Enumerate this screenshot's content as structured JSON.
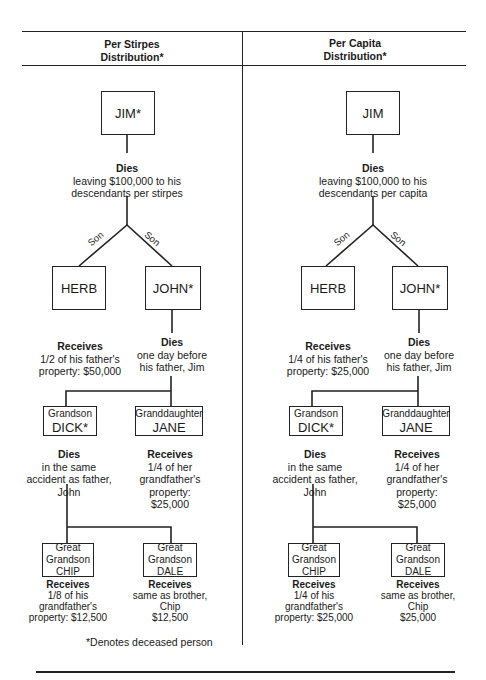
{
  "headers": {
    "left": [
      "Per Stirpes",
      "Distribution*"
    ],
    "right": [
      "Per Capita",
      "Distribution*"
    ]
  },
  "relation_label": "Son",
  "footnote": "*Denotes deceased person",
  "trees": [
    {
      "id": "per-stirpes",
      "jim": {
        "name": "JIM*"
      },
      "jim_text": {
        "title": "Dies",
        "lines": [
          "leaving $100,000 to his",
          "descendants per stirpes"
        ]
      },
      "herb": {
        "name": "HERB"
      },
      "herb_text": {
        "title": "Receives",
        "lines": [
          "1/2 of his father's",
          "property: $50,000"
        ]
      },
      "john": {
        "name": "JOHN*"
      },
      "john_text": {
        "title": "Dies",
        "lines": [
          "one day before",
          "his father, Jim"
        ]
      },
      "dick": {
        "role": "Grandson",
        "name": "DICK*"
      },
      "dick_text": {
        "title": "Dies",
        "lines": [
          "in the same",
          "accident as father,",
          "John"
        ]
      },
      "jane": {
        "role": "Granddaughter",
        "name": "JANE"
      },
      "jane_text": {
        "title": "Receives",
        "lines": [
          "1/4 of her",
          "grandfather's",
          "property:",
          "$25,000"
        ]
      },
      "chip": {
        "role1": "Great",
        "role2": "Grandson",
        "name": "CHIP"
      },
      "chip_text": {
        "title": "Receives",
        "lines": [
          "1/8 of his",
          "grandfather's",
          "property: $12,500"
        ]
      },
      "dale": {
        "role1": "Great",
        "role2": "Grandson",
        "name": "DALE"
      },
      "dale_text": {
        "title": "Receives",
        "lines": [
          "same as brother,",
          "Chip",
          "$12,500"
        ]
      }
    },
    {
      "id": "per-capita",
      "jim": {
        "name": "JIM"
      },
      "jim_text": {
        "title": "Dies",
        "lines": [
          "leaving $100,000 to his",
          "descendants per capita"
        ]
      },
      "herb": {
        "name": "HERB"
      },
      "herb_text": {
        "title": "Receives",
        "lines": [
          "1/4 of his father's",
          "property: $25,000"
        ]
      },
      "john": {
        "name": "JOHN*"
      },
      "john_text": {
        "title": "Dies",
        "lines": [
          "one day before",
          "his father, Jim"
        ]
      },
      "dick": {
        "role": "Grandson",
        "name": "DICK*"
      },
      "dick_text": {
        "title": "Dies",
        "lines": [
          "in the same",
          "accident as father,",
          "John"
        ]
      },
      "jane": {
        "role": "Granddaughter",
        "name": "JANE"
      },
      "jane_text": {
        "title": "Receives",
        "lines": [
          "1/4 of her",
          "grandfather's",
          "property:",
          "$25,000"
        ]
      },
      "chip": {
        "role1": "Great",
        "role2": "Grandson",
        "name": "CHIP"
      },
      "chip_text": {
        "title": "Receives",
        "lines": [
          "1/4 of his",
          "grandfather's",
          "property: $25,000"
        ]
      },
      "dale": {
        "role1": "Great",
        "role2": "Grandson",
        "name": "DALE"
      },
      "dale_text": {
        "title": "Receives",
        "lines": [
          "same as brother,",
          "Chip",
          "$25,000"
        ]
      }
    }
  ]
}
